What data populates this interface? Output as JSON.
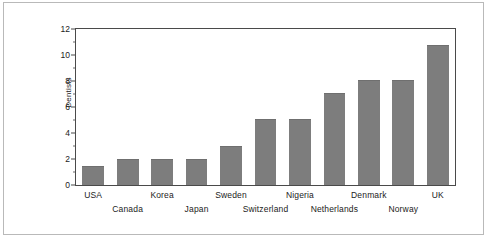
{
  "chart_data": {
    "type": "bar",
    "title": "",
    "subtitle": "",
    "xlabel": "",
    "ylabel": "Dentists",
    "categories": [
      "USA",
      "Canada",
      "Korea",
      "Japan",
      "Sweden",
      "Switzerland",
      "Nigeria",
      "Netherlands",
      "Denmark",
      "Norway",
      "UK"
    ],
    "values": [
      1.5,
      2.0,
      2.0,
      2.0,
      3.0,
      5.1,
      5.1,
      7.1,
      8.1,
      8.1,
      10.8
    ],
    "ylim": [
      0,
      12
    ],
    "y_ticks": [
      0,
      2,
      4,
      6,
      8,
      10,
      12
    ],
    "y_minor_ticks": [
      1,
      3,
      5,
      7,
      9,
      11
    ],
    "grid": false,
    "legend": false,
    "legend_position": "none",
    "bar_color": "#7d7d7d",
    "axis_color": "#4a4a4a",
    "text_color": "#1b1b1b",
    "frame_color": "#b9b9b9",
    "background": "#ffffff",
    "label_rows": [
      0,
      1,
      0,
      1,
      0,
      1,
      0,
      1,
      0,
      1,
      0
    ],
    "annotations": []
  }
}
